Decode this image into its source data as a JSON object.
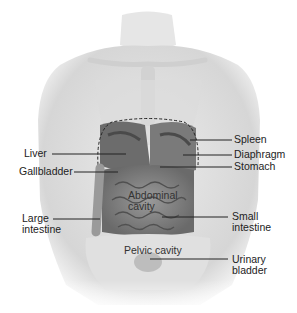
{
  "diagram": {
    "type": "anatomical-illustration",
    "labels_left": [
      {
        "id": "liver",
        "text": "Liver"
      },
      {
        "id": "gallbladder",
        "text": "Gallbladder"
      },
      {
        "id": "large_intestine_1",
        "text": "Large"
      },
      {
        "id": "large_intestine_2",
        "text": "intestine"
      }
    ],
    "labels_right": [
      {
        "id": "spleen",
        "text": "Spleen"
      },
      {
        "id": "diaphragm",
        "text": "Diaphragm"
      },
      {
        "id": "stomach",
        "text": "Stomach"
      },
      {
        "id": "small_intestine_1",
        "text": "Small"
      },
      {
        "id": "small_intestine_2",
        "text": "intestine"
      },
      {
        "id": "urinary_bladder_1",
        "text": "Urinary"
      },
      {
        "id": "urinary_bladder_2",
        "text": "bladder"
      }
    ],
    "region_labels": [
      {
        "id": "abdominal_cavity_1",
        "text": "Abdominal"
      },
      {
        "id": "abdominal_cavity_2",
        "text": "cavity"
      },
      {
        "id": "pelvic_cavity",
        "text": "Pelvic cavity"
      }
    ],
    "colors": {
      "skin": "#e2e2e2",
      "skin_shadow": "#c8c8c8",
      "organ_dark": "#5a5a5a",
      "organ_mid": "#8a8a8a",
      "leader_line": "#222222"
    }
  }
}
